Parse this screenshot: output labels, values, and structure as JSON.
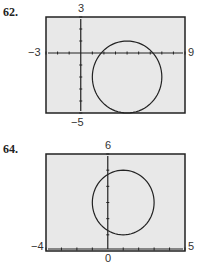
{
  "chart_data": [
    {
      "type": "line",
      "problem_number": "62.",
      "title": "",
      "description": "Graphing calculator window showing a circle",
      "window": {
        "xmin": -3,
        "xmax": 9,
        "ymin": -5,
        "ymax": 3,
        "xscl": 1,
        "yscl": 1
      },
      "tick_labels": {
        "top": "3",
        "bottom": "-5",
        "left": "-3",
        "right": "9"
      },
      "series": [
        {
          "name": "circle",
          "center": [
            4,
            -2
          ],
          "radius": 3
        }
      ],
      "grid": false
    },
    {
      "type": "line",
      "problem_number": "64.",
      "title": "",
      "description": "Graphing calculator window showing a circle",
      "window": {
        "xmin": -4,
        "xmax": 5,
        "ymin": 0,
        "ymax": 6,
        "xscl": 1,
        "yscl": 1
      },
      "tick_labels": {
        "top": "6",
        "bottom": "0",
        "left": "-4",
        "right": "5"
      },
      "series": [
        {
          "name": "circle",
          "center": [
            1,
            3
          ],
          "radius": 2
        }
      ],
      "grid": false
    }
  ],
  "labels": {
    "p1": {
      "num": "62.",
      "top": "3",
      "bottom": "−5",
      "left": "−3",
      "right": "9"
    },
    "p2": {
      "num": "64.",
      "top": "6",
      "bottom": "0",
      "left": "−4",
      "right": "5"
    }
  },
  "colors": {
    "screen": "#e8e8e8",
    "ink": "#222222"
  }
}
